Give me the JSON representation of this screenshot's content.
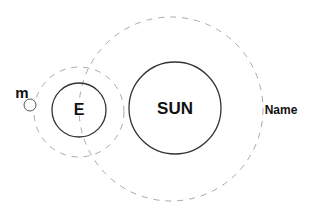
{
  "diagram": {
    "type": "sun-earth-moon orbit diagram",
    "colors": {
      "background": "#ffffff",
      "body_stroke": "#333333",
      "orbit_stroke": "#aaaaaa",
      "text": "#111111"
    },
    "bodies": {
      "sun": {
        "label": "SUN",
        "cx": 175,
        "cy": 108,
        "r": 46
      },
      "earth": {
        "label": "E",
        "cx": 79,
        "cy": 110,
        "r": 27
      },
      "moon": {
        "label": "m",
        "cx": 30,
        "cy": 105,
        "r": 6
      }
    },
    "orbits": {
      "earth_orbit_around_sun": {
        "cx": 171,
        "cy": 109,
        "r": 92,
        "style": "dashed"
      },
      "moon_orbit_around_earth": {
        "cx": 79,
        "cy": 112,
        "r": 45,
        "style": "dashed"
      }
    },
    "caption": "Name"
  }
}
